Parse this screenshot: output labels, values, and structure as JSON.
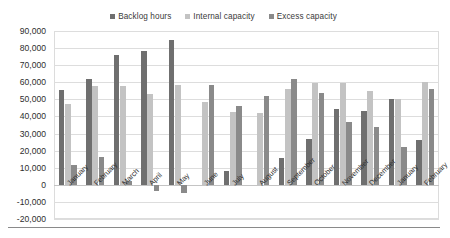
{
  "chart_data": {
    "type": "bar",
    "title": "",
    "subtitle": "",
    "xlabel": "",
    "ylabel": "",
    "ylim": [
      -20000,
      90000
    ],
    "ytick_step": 10000,
    "ytick_labels": [
      "90,000",
      "80,000",
      "70,000",
      "60,000",
      "50,000",
      "40,000",
      "30,000",
      "20,000",
      "10,000",
      "0",
      "-10,000",
      "-20,000"
    ],
    "ytick_values": [
      90000,
      80000,
      70000,
      60000,
      50000,
      40000,
      30000,
      20000,
      10000,
      0,
      -10000,
      -20000
    ],
    "grid": true,
    "legend_position": "top",
    "categories": [
      "January",
      "February",
      "March",
      "April",
      "May",
      "June",
      "July",
      "August",
      "September",
      "October",
      "November",
      "December",
      "January",
      "February"
    ],
    "series": [
      {
        "name": "Backlog hours",
        "color": "#6f6f6f",
        "values": [
          55500,
          62000,
          76000,
          78500,
          85000,
          0,
          8000,
          0,
          15500,
          27000,
          44500,
          43000,
          50000,
          26000
        ]
      },
      {
        "name": "Internal capacity",
        "color": "#c3c3c3",
        "values": [
          47500,
          58000,
          58000,
          53000,
          58500,
          48500,
          42500,
          42000,
          56000,
          59500,
          59500,
          55000,
          50000,
          60000
        ]
      },
      {
        "name": "Excess capacity",
        "color": "#8a8a8a",
        "values": [
          11500,
          16000,
          2500,
          -3500,
          -5000,
          58500,
          46000,
          52000,
          62000,
          54000,
          37000,
          34000,
          22000,
          56000
        ]
      }
    ]
  },
  "legend": {
    "items": [
      {
        "label": "Backlog hours",
        "color": "#6f6f6f"
      },
      {
        "label": "Internal capacity",
        "color": "#c3c3c3"
      },
      {
        "label": "Excess capacity",
        "color": "#8a8a8a"
      }
    ]
  },
  "colors": {
    "backlog": "#6f6f6f",
    "internal": "#c3c3c3",
    "excess": "#8a8a8a",
    "grid": "#dddddd",
    "axis_text": "#2e2e2e",
    "background": "#ffffff"
  }
}
